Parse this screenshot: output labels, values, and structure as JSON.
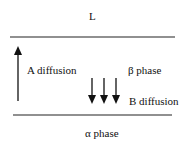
{
  "diagram": {
    "regions": {
      "top": "L",
      "middle": "β phase",
      "bottom": "α phase"
    },
    "arrows": [
      {
        "label": "A diffusion",
        "direction": "up",
        "count": 1
      },
      {
        "label": "B diffusion",
        "direction": "down",
        "count": 3
      }
    ],
    "colors": {
      "line": "#222222",
      "background": "#ffffff"
    }
  }
}
